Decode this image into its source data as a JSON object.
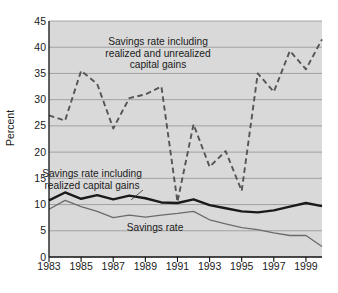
{
  "chart_data": {
    "type": "line",
    "title": "",
    "xlabel": "",
    "ylabel": "Percent",
    "xlim": [
      1983,
      2000
    ],
    "ylim": [
      0,
      45
    ],
    "grid": true,
    "legend_position": "inline-annotations",
    "xticks": [
      1983,
      1985,
      1987,
      1989,
      1991,
      1993,
      1995,
      1997,
      1999
    ],
    "xtick_labels": [
      "1983",
      "1985",
      "1987",
      "1989",
      "1991",
      "1993",
      "1995",
      "1997",
      "1999"
    ],
    "yticks": [
      0,
      5,
      10,
      15,
      20,
      25,
      30,
      35,
      40,
      45
    ],
    "ytick_labels": [
      "0",
      "5",
      "10",
      "15",
      "20",
      "25",
      "30",
      "35",
      "40",
      "45"
    ],
    "x": [
      1983,
      1984,
      1985,
      1986,
      1987,
      1988,
      1989,
      1990,
      1991,
      1992,
      1993,
      1994,
      1995,
      1996,
      1997,
      1998,
      1999,
      2000
    ],
    "series": [
      {
        "name": "Savings rate including realized and unrealized capital gains",
        "style": "dashed",
        "color": "#555555",
        "values": [
          27.0,
          26.0,
          35.5,
          33.0,
          24.5,
          30.3,
          31.0,
          32.5,
          10.5,
          25.3,
          17.2,
          20.2,
          12.6,
          35.0,
          31.5,
          39.3,
          35.8,
          41.5
        ]
      },
      {
        "name": "Savings rate including realized capital gains",
        "style": "solid-thick",
        "color": "#1a1a1a",
        "values": [
          10.8,
          12.3,
          11.1,
          11.8,
          11.0,
          11.7,
          11.2,
          10.4,
          10.3,
          11.0,
          9.9,
          9.3,
          8.7,
          8.5,
          8.9,
          9.6,
          10.3,
          9.7
        ]
      },
      {
        "name": "Savings rate",
        "style": "solid-thin",
        "color": "#6b6b6b",
        "values": [
          9.1,
          10.8,
          9.6,
          8.7,
          7.5,
          8.0,
          7.6,
          8.0,
          8.3,
          8.7,
          7.1,
          6.3,
          5.6,
          5.2,
          4.6,
          4.1,
          4.1,
          2.0
        ]
      }
    ],
    "annotations": [
      {
        "id": "unrealized",
        "text": "Savings rate including\nrealized and unrealized\ncapital gains"
      },
      {
        "id": "realized",
        "text": "Savings rate including\nrealized capital gains"
      },
      {
        "id": "savings",
        "text": "Savings rate"
      }
    ]
  }
}
